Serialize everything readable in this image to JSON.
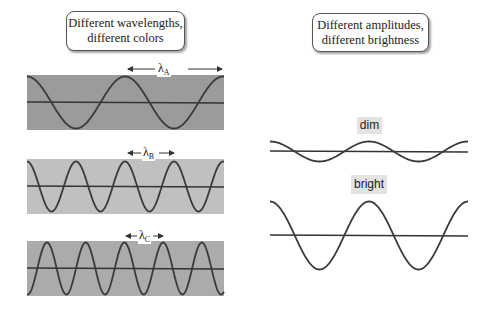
{
  "left_panel": {
    "title_line1": "Different wavelengths,",
    "title_line2": "different colors",
    "waves": [
      {
        "id": "A",
        "label": "λ",
        "subscript": "A",
        "background": "#9b9b9b",
        "wavelength_px": 98,
        "amplitude_px": 26
      },
      {
        "id": "B",
        "label": "λ",
        "subscript": "B",
        "background": "#c0c0c0",
        "wavelength_px": 49,
        "amplitude_px": 25
      },
      {
        "id": "C",
        "label": "λ",
        "subscript": "C",
        "background": "#ababab",
        "wavelength_px": 38.7,
        "amplitude_px": 26
      }
    ]
  },
  "right_panel": {
    "title_line1": "Different amplitudes,",
    "title_line2": "different brightness",
    "waves": [
      {
        "id": "dim",
        "label": "dim",
        "wavelength_px": 99,
        "amplitude_px": 10
      },
      {
        "id": "bright",
        "label": "bright",
        "wavelength_px": 99,
        "amplitude_px": 34
      }
    ]
  },
  "colors": {
    "wave_stroke": "#3a3a3a",
    "axis_stroke": "#333333",
    "label_bg": "#e3e3e3"
  }
}
